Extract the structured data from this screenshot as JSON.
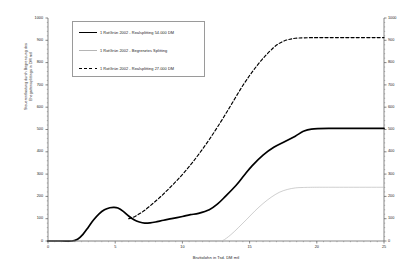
{
  "chart_data": {
    "type": "line",
    "title": "",
    "xlabel": "Bruttolohn in Tsd. DM mtl",
    "ylabel": "Steuerentlastung durch Begrenzung des\nEhegattensplittings in DM mtl",
    "xlim": [
      0,
      25
    ],
    "ylim": [
      0,
      1000
    ],
    "xticks": [
      0,
      5,
      10,
      15,
      20,
      25
    ],
    "yticks": [
      0,
      100,
      200,
      300,
      400,
      500,
      600,
      700,
      800,
      900,
      1000
    ],
    "yticks_right": [
      0,
      100,
      200,
      300,
      400,
      500,
      600,
      700,
      800,
      900,
      1000
    ],
    "grid": false,
    "legend_position": "upper-left",
    "dual_y_axis": true,
    "series": [
      {
        "name": "1 RotGrün 2002 - Realsplitting 54.000 DM",
        "style": "solid-bold",
        "color": "#000000",
        "x": [
          0,
          1,
          1.8,
          2.2,
          2.6,
          3,
          3.4,
          3.8,
          4.2,
          4.6,
          4.9,
          5.2,
          5.6,
          6,
          6.4,
          6.8,
          7.2,
          7.6,
          8,
          8.6,
          9.2,
          10,
          10.6,
          11.2,
          12,
          12.6,
          13.2,
          14,
          14.6,
          15.2,
          16,
          16.8,
          17.6,
          18.4,
          19,
          19.6,
          21,
          23,
          25
        ],
        "y": [
          0,
          0,
          0,
          8,
          30,
          62,
          95,
          122,
          140,
          149,
          151,
          148,
          133,
          112,
          95,
          85,
          80,
          81,
          85,
          93,
          100,
          110,
          118,
          124,
          140,
          165,
          200,
          250,
          295,
          338,
          385,
          420,
          445,
          470,
          492,
          502,
          505,
          505,
          505
        ]
      },
      {
        "name": "1 RotGrün 2002 - Begrenztes Splitting",
        "style": "solid-thin",
        "color": "#b5b5b5",
        "x": [
          0,
          5,
          10,
          12.6,
          13,
          13.6,
          14.2,
          14.8,
          15.4,
          16,
          16.6,
          17.2,
          17.8,
          18.4,
          19,
          20,
          22,
          25
        ],
        "y": [
          0,
          0,
          0,
          0,
          2,
          28,
          62,
          98,
          135,
          168,
          196,
          218,
          231,
          238,
          240,
          241,
          241,
          241
        ]
      },
      {
        "name": "1 RotGrün 2002 - Realsplitting 27.000 DM",
        "style": "dashed",
        "color": "#000000",
        "x": [
          6,
          6.4,
          6.8,
          7.2,
          7.8,
          8.4,
          9,
          9.6,
          10.2,
          10.8,
          11.4,
          12,
          12.6,
          13.2,
          13.8,
          14.4,
          15,
          15.6,
          16.2,
          16.8,
          17.2,
          17.6,
          18,
          18.4,
          19,
          20,
          22,
          25
        ],
        "y": [
          100,
          108,
          122,
          138,
          168,
          200,
          235,
          272,
          312,
          356,
          404,
          455,
          510,
          568,
          628,
          688,
          742,
          790,
          832,
          868,
          886,
          898,
          905,
          909,
          911,
          912,
          912,
          912
        ]
      }
    ]
  }
}
